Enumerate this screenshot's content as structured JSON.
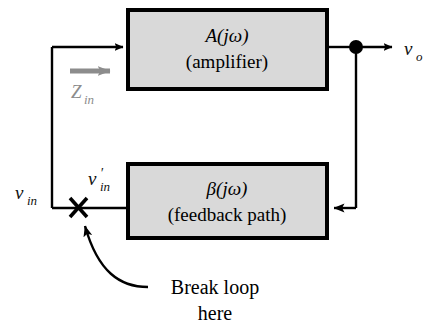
{
  "figure": {
    "type": "feedback-loop-block-diagram",
    "blocks": [
      {
        "id": "amplifier",
        "function_label": "A(jω)",
        "name_label": "(amplifier)",
        "fill_color": "#d9d9d9",
        "border_color": "#000000"
      },
      {
        "id": "feedback",
        "function_label": "β(jω)",
        "name_label": "(feedback path)",
        "fill_color": "#d9d9d9",
        "border_color": "#000000"
      }
    ],
    "signals": {
      "input_label": "v",
      "input_sub": "in",
      "input_prime_label": "v",
      "input_prime_sub": "in",
      "input_prime_mark": "′",
      "output_label": "v",
      "output_sub": "o",
      "impedance_label": "Z",
      "impedance_sub": "in",
      "impedance_color": "#8c8c8c"
    },
    "annotation": {
      "line1": "Break loop",
      "line2": "here",
      "marker": "×"
    }
  }
}
